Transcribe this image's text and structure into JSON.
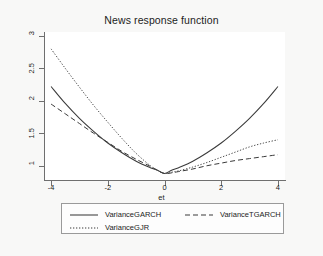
{
  "chart_data": {
    "type": "line",
    "title": "News response function",
    "xlabel": "et",
    "ylabel": "",
    "xlim": [
      -4.25,
      4.25
    ],
    "ylim": [
      0.78,
      3.06
    ],
    "xticks": [
      "-4",
      "-2",
      "0",
      "2",
      "4"
    ],
    "xtick_values": [
      -4,
      -2,
      0,
      2,
      4
    ],
    "yticks": [
      "1",
      "1.5",
      "2",
      "2.5",
      "3"
    ],
    "ytick_values": [
      1,
      1.5,
      2,
      2.5,
      3
    ],
    "grid": false,
    "legend_position": "below",
    "x": [
      -4,
      -3.5,
      -3,
      -2.5,
      -2,
      -1.5,
      -1,
      -0.5,
      -0.25,
      0,
      0.25,
      0.5,
      1,
      1.5,
      2,
      2.5,
      3,
      3.5,
      4
    ],
    "series": [
      {
        "name": "VarianceGARCH",
        "style": "solid",
        "color": "#3a3a3a",
        "values": [
          2.22,
          1.96,
          1.73,
          1.53,
          1.35,
          1.2,
          1.07,
          0.97,
          0.93,
          0.88,
          0.93,
          0.97,
          1.07,
          1.2,
          1.35,
          1.53,
          1.73,
          1.96,
          2.22
        ]
      },
      {
        "name": "VarianceTGARCH",
        "style": "dashed",
        "color": "#3a3a3a",
        "values": [
          1.95,
          1.8,
          1.65,
          1.5,
          1.36,
          1.22,
          1.1,
          0.99,
          0.93,
          0.88,
          0.89,
          0.91,
          0.95,
          1.0,
          1.04,
          1.08,
          1.11,
          1.14,
          1.17
        ]
      },
      {
        "name": "VarianceGJR",
        "style": "dotted",
        "color": "#4a4a4a",
        "values": [
          2.8,
          2.5,
          2.21,
          1.93,
          1.67,
          1.42,
          1.19,
          1.0,
          0.93,
          0.88,
          0.9,
          0.92,
          0.98,
          1.05,
          1.13,
          1.21,
          1.29,
          1.35,
          1.4
        ]
      }
    ]
  },
  "legend": {
    "entries": [
      {
        "label": "VarianceGARCH",
        "style": "solid"
      },
      {
        "label": "VarianceTGARCH",
        "style": "dashed"
      },
      {
        "label": "VarianceGJR",
        "style": "dotted"
      }
    ]
  },
  "colors": {
    "page_background": "#f8f8f7",
    "plot_background": "#ffffff",
    "axis": "#6f6f6f",
    "text": "#1c1c1c",
    "legend_border": "#9a9a9a"
  }
}
